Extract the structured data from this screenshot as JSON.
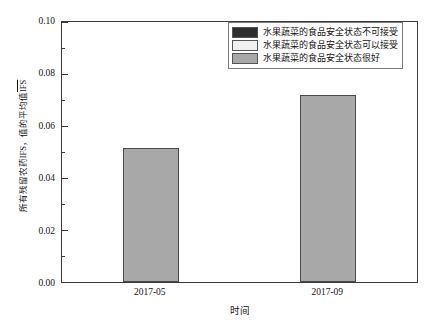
{
  "chart_data": {
    "type": "bar",
    "title": "",
    "subtitle": "",
    "xlabel": "时间",
    "ylabel_parts": {
      "prefix": "所有残留农药IFS，值的平均值",
      "overline": "IFS"
    },
    "ylabel": "所有残留农药IFS，值的平均值IFS",
    "categories": [
      "2017-05",
      "2017-09"
    ],
    "values": [
      0.0515,
      0.0718
    ],
    "series": [
      {
        "name": "水果蔬菜的食品安全状态很好",
        "values": [
          0.0515,
          0.0718
        ],
        "color": "#a8a8a8"
      }
    ],
    "ylim": [
      0.0,
      0.1
    ],
    "y_ticks": [
      "0.00",
      "0.02",
      "0.04",
      "0.06",
      "0.08",
      "0.10"
    ],
    "y_tick_values": [
      0.0,
      0.02,
      0.04,
      0.06,
      0.08,
      0.1
    ],
    "y_minor_tick_values": [
      0.01,
      0.03,
      0.05,
      0.07,
      0.09
    ],
    "grid": "off",
    "legend_position": "top-right",
    "bar_fill_color": "#a8a8a8",
    "bar_edge_color": "#4a4a4a",
    "axis_color": "#3b3b3b",
    "background_color": "#ffffff"
  },
  "legend": {
    "items": [
      {
        "label": "水果蔬菜的食品安全状态不可接受",
        "color": "#2e2e2e"
      },
      {
        "label": "水果蔬菜的食品安全状态可以接受",
        "color": "#f0f0f0"
      },
      {
        "label": "水果蔬菜的食品安全状态很好",
        "color": "#a8a8a8"
      }
    ]
  }
}
